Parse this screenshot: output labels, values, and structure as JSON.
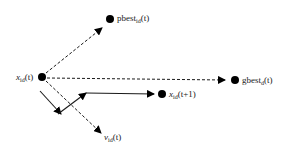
{
  "diagram": {
    "type": "particle-velocity-update",
    "nodes": {
      "current": {
        "label_main": "x",
        "label_sub": "id",
        "label_arg": "(t)"
      },
      "pbest": {
        "label_main": "pbest",
        "label_sub": "id",
        "label_arg": "(t)"
      },
      "gbest": {
        "label_main": "gbest",
        "label_sub": "d",
        "label_arg": "(t)"
      },
      "next": {
        "label_main": "x",
        "label_sub": "id",
        "label_arg": "(t+1)"
      },
      "velocity": {
        "label_main": "v",
        "label_sub": "id",
        "label_arg": "(t)"
      }
    },
    "edges": [
      {
        "from": "current",
        "to": "pbest",
        "style": "dashed"
      },
      {
        "from": "current",
        "to": "gbest",
        "style": "dashed"
      },
      {
        "from": "current",
        "to": "velocity",
        "style": "dashed"
      },
      {
        "from": "current",
        "to": "intermediate",
        "style": "solid"
      },
      {
        "from": "intermediate",
        "to": "next",
        "style": "solid"
      }
    ],
    "colors": {
      "line": "#1a1a1a",
      "node": "#000000",
      "background": "#ffffff"
    }
  }
}
